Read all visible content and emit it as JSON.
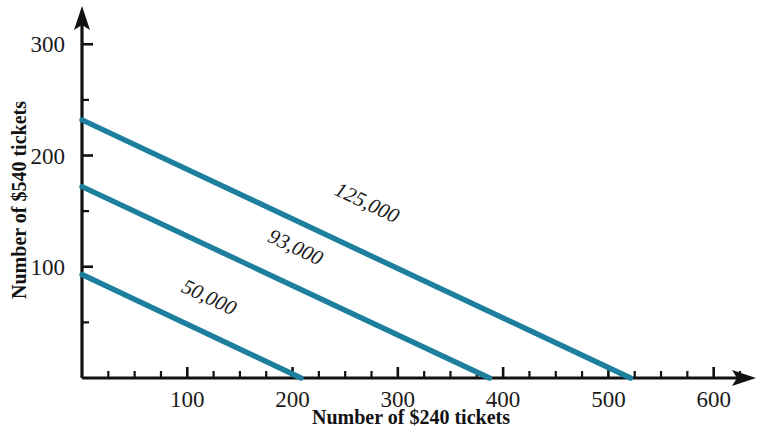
{
  "chart_data": {
    "type": "line",
    "title": "",
    "xlabel": "Number of $240 tickets",
    "ylabel": "Number of $540 tickets",
    "xlim": [
      0,
      625
    ],
    "ylim": [
      0,
      320
    ],
    "grid": false,
    "legend_position": "inline-curve-labels",
    "x_ticks_major": [
      100,
      200,
      300,
      400,
      500,
      600
    ],
    "x_tick_labels": [
      "100",
      "200",
      "300",
      "400",
      "500",
      "600"
    ],
    "x_tick_minor_step": 25,
    "y_ticks_major": [
      100,
      200,
      300
    ],
    "y_tick_labels": [
      "100",
      "200",
      "300"
    ],
    "y_tick_minor_step": 50,
    "series": [
      {
        "name": "50,000",
        "label": "50,000",
        "color": "#1c7f9e",
        "x": [
          0,
          208
        ],
        "y": [
          93,
          0
        ],
        "label_x": 118,
        "label_y": 67
      },
      {
        "name": "93,000",
        "label": "93,000",
        "color": "#1c7f9e",
        "x": [
          0,
          387
        ],
        "y": [
          172,
          0
        ],
        "label_x": 200,
        "label_y": 112
      },
      {
        "name": "125,000",
        "label": "125,000",
        "color": "#1c7f9e",
        "x": [
          0,
          521
        ],
        "y": [
          232,
          0
        ],
        "label_x": 268,
        "label_y": 152
      }
    ]
  },
  "axes": {
    "x_title": "Number of $240 tickets",
    "y_title": "Number of $540 tickets"
  },
  "colors": {
    "line": "#1c7f9e",
    "axis": "#111111",
    "background": "#ffffff"
  }
}
